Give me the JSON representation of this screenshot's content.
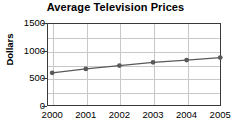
{
  "chart_data": {
    "type": "line",
    "title": "Average Television Prices",
    "xlabel": "",
    "ylabel": "Dollars",
    "categories": [
      "2000",
      "2001",
      "2002",
      "2003",
      "2004",
      "2005"
    ],
    "x": [
      2000,
      2001,
      2002,
      2003,
      2004,
      2005
    ],
    "values": [
      600,
      670,
      730,
      790,
      830,
      875
    ],
    "series": [
      {
        "name": "Average Television Price",
        "values": [
          600,
          670,
          730,
          790,
          830,
          875
        ]
      }
    ],
    "ylim": [
      0,
      1500
    ],
    "ytick_labels": [
      "0",
      "500",
      "1000",
      "1500"
    ],
    "ytick_values": [
      0,
      500,
      1000,
      1500
    ],
    "ygrid_values": [
      0,
      250,
      500,
      750,
      1000,
      1250,
      1500
    ],
    "grid": true,
    "legend": "none",
    "marker": "circle",
    "line_color": "#595959",
    "marker_color": "#595959",
    "grid_color": "#c8c8c8",
    "axis_color": "#3a3a3a",
    "text_color": "#000000",
    "background": "#ffffff"
  }
}
